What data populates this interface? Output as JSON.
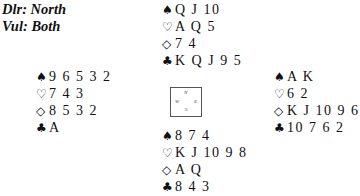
{
  "header": {
    "dealer": "Dlr: North",
    "vulnerability": "Vul: Both"
  },
  "suits": {
    "spades": "♠",
    "hearts": "♡",
    "diamonds": "◇",
    "clubs": "♣"
  },
  "hands": {
    "north": {
      "spades": "Q J 10",
      "hearts": "A Q 5",
      "diamonds": "7 4",
      "clubs": "K Q J 9 5"
    },
    "west": {
      "spades": "9 6 5 3 2",
      "hearts": "7 4 3",
      "diamonds": "8 5 3 2",
      "clubs": "A"
    },
    "east": {
      "spades": "A K",
      "hearts": "6 2",
      "diamonds": "K J 10 9 6",
      "clubs": "10 7 6 2"
    },
    "south": {
      "spades": "8 7 4",
      "hearts": "K J 10 9 8",
      "diamonds": "A Q",
      "clubs": "8 4 3"
    }
  },
  "compass": {
    "n": "N",
    "w": "W",
    "e": "E",
    "s": "S"
  }
}
